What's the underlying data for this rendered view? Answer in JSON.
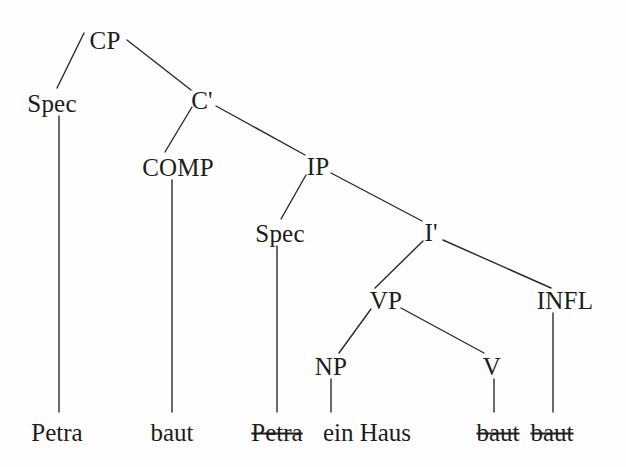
{
  "diagram": {
    "kind": "syntax-tree",
    "sentence": "Petra baut ein Haus",
    "background_color": "#fefefe",
    "line_color": "#2a2a2a",
    "text_color": "#1c1c1c",
    "nodes": [
      {
        "id": "cp",
        "label": "CP",
        "x": 105,
        "y": 40
      },
      {
        "id": "spec1",
        "label": "Spec",
        "x": 52,
        "y": 103
      },
      {
        "id": "cbar",
        "label": "C'",
        "x": 202,
        "y": 100
      },
      {
        "id": "comp",
        "label": "COMP",
        "x": 178,
        "y": 167
      },
      {
        "id": "ip",
        "label": "IP",
        "x": 318,
        "y": 166
      },
      {
        "id": "spec2",
        "label": "Spec",
        "x": 280,
        "y": 233
      },
      {
        "id": "ibar",
        "label": "I'",
        "x": 431,
        "y": 232
      },
      {
        "id": "vp",
        "label": "VP",
        "x": 386,
        "y": 300
      },
      {
        "id": "infl",
        "label": "INFL",
        "x": 565,
        "y": 300
      },
      {
        "id": "np",
        "label": "NP",
        "x": 331,
        "y": 366
      },
      {
        "id": "v",
        "label": "V",
        "x": 492,
        "y": 366
      }
    ],
    "terminals": [
      {
        "id": "t-petra",
        "label": "Petra",
        "struck": false,
        "x": 57,
        "y": 432
      },
      {
        "id": "t-baut",
        "label": "baut",
        "struck": false,
        "x": 172,
        "y": 432
      },
      {
        "id": "t-petra-tr",
        "label": "Petra",
        "struck": true,
        "x": 277,
        "y": 432
      },
      {
        "id": "t-ein-haus",
        "label": "ein Haus",
        "struck": false,
        "x": 367,
        "y": 432
      },
      {
        "id": "t-baut-tr1",
        "label": "baut",
        "struck": true,
        "x": 498,
        "y": 432
      },
      {
        "id": "t-baut-tr2",
        "label": "baut",
        "struck": true,
        "x": 552,
        "y": 432
      }
    ],
    "edges": [
      {
        "id": "cp-spec1",
        "from": "CP",
        "to": "Spec",
        "x1": 84,
        "y1": 33,
        "x2": 57,
        "y2": 88
      },
      {
        "id": "cp-cbar",
        "from": "CP",
        "to": "C'",
        "x1": 127,
        "y1": 40,
        "x2": 191,
        "y2": 90
      },
      {
        "id": "cbar-comp",
        "from": "C'",
        "to": "COMP",
        "x1": 192,
        "y1": 107,
        "x2": 165,
        "y2": 152
      },
      {
        "id": "cbar-ip",
        "from": "C'",
        "to": "IP",
        "x1": 216,
        "y1": 106,
        "x2": 305,
        "y2": 155
      },
      {
        "id": "ip-spec2",
        "from": "IP",
        "to": "Spec",
        "x1": 306,
        "y1": 175,
        "x2": 281,
        "y2": 219
      },
      {
        "id": "ip-ibar",
        "from": "IP",
        "to": "I'",
        "x1": 331,
        "y1": 173,
        "x2": 422,
        "y2": 221
      },
      {
        "id": "ibar-vp",
        "from": "I'",
        "to": "VP",
        "x1": 423,
        "y1": 241,
        "x2": 375,
        "y2": 288
      },
      {
        "id": "ibar-infl",
        "from": "I'",
        "to": "INFL",
        "x1": 443,
        "y1": 240,
        "x2": 551,
        "y2": 288
      },
      {
        "id": "vp-np",
        "from": "VP",
        "to": "NP",
        "x1": 371,
        "y1": 309,
        "x2": 339,
        "y2": 353
      },
      {
        "id": "vp-v",
        "from": "VP",
        "to": "V",
        "x1": 401,
        "y1": 308,
        "x2": 484,
        "y2": 353
      },
      {
        "id": "spec1-petra",
        "from": "Spec",
        "to": "Petra",
        "x1": 59,
        "y1": 116,
        "x2": 59,
        "y2": 412
      },
      {
        "id": "comp-baut",
        "from": "COMP",
        "to": "baut",
        "x1": 172,
        "y1": 180,
        "x2": 172,
        "y2": 412
      },
      {
        "id": "spec2-trace",
        "from": "Spec",
        "to": "Petra",
        "x1": 277,
        "y1": 246,
        "x2": 277,
        "y2": 412
      },
      {
        "id": "np-einhaus",
        "from": "NP",
        "to": "ein",
        "x1": 331,
        "y1": 379,
        "x2": 331,
        "y2": 412
      },
      {
        "id": "infl-baut",
        "from": "INFL",
        "to": "baut",
        "x1": 553,
        "y1": 313,
        "x2": 553,
        "y2": 412
      },
      {
        "id": "v-baut",
        "from": "V",
        "to": "baut",
        "x1": 494,
        "y1": 379,
        "x2": 494,
        "y2": 412
      }
    ]
  }
}
